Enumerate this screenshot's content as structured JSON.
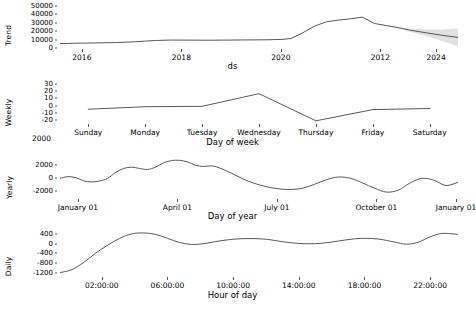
{
  "figure": {
    "background": "#ffffff",
    "line_color": "#595959",
    "band_color": "#b8b8b8",
    "tick_color": "#555555"
  },
  "stray_label": "2000",
  "chart_data": [
    {
      "type": "line",
      "name": "trend",
      "title": "",
      "ylabel": "Trend",
      "xlabel": "ds",
      "yticks": [
        "50000",
        "40000",
        "30000",
        "20000",
        "10000",
        "0"
      ],
      "ytick_values": [
        50000,
        40000,
        30000,
        20000,
        10000,
        0
      ],
      "ylim": [
        0,
        52000
      ],
      "xticks": [
        "2016",
        "2018",
        "2020",
        "2012",
        "2024"
      ],
      "xtick_pos": [
        0.055,
        0.305,
        0.555,
        0.805,
        0.945
      ],
      "grid": false,
      "has_uncertainty_band": true,
      "x": [
        0.0,
        0.04,
        0.09,
        0.14,
        0.19,
        0.24,
        0.28,
        0.33,
        0.38,
        0.43,
        0.48,
        0.52,
        0.56,
        0.58,
        0.61,
        0.64,
        0.67,
        0.7,
        0.73,
        0.76,
        0.79,
        0.82,
        0.85,
        0.88,
        0.92,
        0.96,
        1.0
      ],
      "values": [
        5200,
        5600,
        6000,
        6400,
        7400,
        8900,
        9400,
        9300,
        9200,
        9400,
        9600,
        9700,
        10200,
        11200,
        18000,
        26000,
        31000,
        33000,
        34500,
        36500,
        29000,
        26500,
        24000,
        21000,
        18000,
        15000,
        12500
      ]
    },
    {
      "type": "line",
      "name": "weekly",
      "title": "",
      "ylabel": "Weekly",
      "xlabel": "Day of week",
      "yticks": [
        "30",
        "20",
        "10",
        "0",
        "-10",
        "-20"
      ],
      "ytick_values": [
        30,
        20,
        10,
        0,
        -10,
        -20
      ],
      "ylim": [
        -24,
        34
      ],
      "xticks": [
        "Sunday",
        "Monday",
        "Tuesday",
        "Wednesday",
        "Thursday",
        "Friday",
        "Saturday"
      ],
      "xtick_pos": [
        0.071,
        0.214,
        0.357,
        0.5,
        0.643,
        0.786,
        0.929
      ],
      "grid": false,
      "has_uncertainty_band": false,
      "x": [
        0.071,
        0.214,
        0.357,
        0.5,
        0.643,
        0.786,
        0.929
      ],
      "values": [
        -5.0,
        -1.5,
        -1.0,
        16.5,
        -21.0,
        -5.5,
        -4.0
      ]
    },
    {
      "type": "line",
      "name": "yearly",
      "title": "",
      "ylabel": "Yearly",
      "xlabel": "Day of year",
      "yticks": [
        "2000",
        "0",
        "-2000"
      ],
      "ytick_values": [
        2000,
        0,
        -2000
      ],
      "ylim": [
        -3000,
        3400
      ],
      "xticks": [
        "January 01",
        "April 01",
        "July 01",
        "October 01",
        "January 01"
      ],
      "xtick_pos": [
        0.045,
        0.295,
        0.545,
        0.795,
        0.995
      ],
      "grid": false,
      "has_uncertainty_band": false,
      "x": [
        0.0,
        0.02,
        0.04,
        0.06,
        0.08,
        0.1,
        0.12,
        0.14,
        0.16,
        0.18,
        0.2,
        0.22,
        0.24,
        0.26,
        0.28,
        0.3,
        0.32,
        0.34,
        0.36,
        0.38,
        0.4,
        0.43,
        0.46,
        0.49,
        0.52,
        0.55,
        0.58,
        0.61,
        0.64,
        0.67,
        0.7,
        0.73,
        0.76,
        0.79,
        0.82,
        0.85,
        0.88,
        0.91,
        0.94,
        0.97,
        1.0
      ],
      "values": [
        0,
        250,
        100,
        -400,
        -550,
        -400,
        0,
        900,
        1500,
        1700,
        1500,
        1350,
        1700,
        2350,
        2700,
        2750,
        2500,
        2000,
        1800,
        1900,
        1600,
        800,
        -100,
        -800,
        -1300,
        -1600,
        -1700,
        -1500,
        -900,
        -200,
        200,
        0,
        -700,
        -1500,
        -2100,
        -1800,
        -700,
        0,
        -300,
        -1100,
        -600
      ]
    },
    {
      "type": "line",
      "name": "daily",
      "title": "",
      "ylabel": "Daily",
      "xlabel": "Hour of day",
      "yticks": [
        "400",
        "0",
        "-400",
        "-800",
        "-1200"
      ],
      "ytick_values": [
        400,
        0,
        -400,
        -800,
        -1200
      ],
      "ylim": [
        -1320,
        560
      ],
      "xticks": [
        "02:00:00",
        "06:00:00",
        "10:00:00",
        "14:00:00",
        "18:00:00",
        "22:00:00"
      ],
      "xtick_pos": [
        0.105,
        0.27,
        0.435,
        0.6,
        0.765,
        0.93
      ],
      "grid": false,
      "has_uncertainty_band": false,
      "x": [
        0.0,
        0.03,
        0.06,
        0.09,
        0.12,
        0.15,
        0.18,
        0.21,
        0.24,
        0.27,
        0.3,
        0.33,
        0.36,
        0.4,
        0.44,
        0.48,
        0.52,
        0.56,
        0.6,
        0.64,
        0.68,
        0.72,
        0.76,
        0.8,
        0.84,
        0.87,
        0.9,
        0.93,
        0.96,
        1.0
      ],
      "values": [
        -1180,
        -1060,
        -760,
        -380,
        -60,
        220,
        400,
        440,
        380,
        220,
        50,
        -30,
        0,
        110,
        190,
        210,
        180,
        80,
        10,
        0,
        60,
        160,
        220,
        190,
        70,
        -20,
        60,
        280,
        420,
        380
      ]
    }
  ]
}
